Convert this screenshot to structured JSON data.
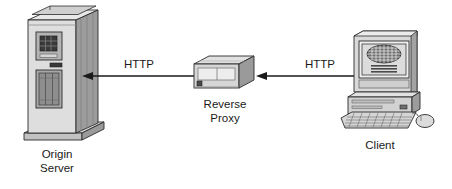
{
  "diagram": {
    "background_color": "#ffffff",
    "line_color": "#1a1a1a",
    "text_color": "#1a1a1a",
    "nodes": [
      {
        "id": "origin-server",
        "icon": "server-tower-icon",
        "label_line1": "Origin",
        "label_line2": "Server",
        "label_position": "below"
      },
      {
        "id": "reverse-proxy",
        "icon": "rack-appliance-icon",
        "label_line1": "Reverse",
        "label_line2": "Proxy",
        "label_position": "below"
      },
      {
        "id": "client",
        "icon": "desktop-computer-icon",
        "label_line1": "Client",
        "label_line2": "",
        "label_position": "below"
      }
    ],
    "connections": [
      {
        "id": "proxy-to-origin",
        "from": "reverse-proxy",
        "to": "origin-server",
        "label": "HTTP",
        "direction": "left",
        "arrowhead": "at-origin-server"
      },
      {
        "id": "client-to-proxy",
        "from": "client",
        "to": "reverse-proxy",
        "label": "HTTP",
        "direction": "left",
        "arrowhead": "at-reverse-proxy"
      }
    ],
    "palette": {
      "shade_light": "#e4e4e4",
      "shade_mid": "#c4c4c4",
      "shade_dark": "#9a9a9a",
      "shade_darker": "#6f6f6f",
      "outline": "#2b2b2b",
      "screen_fill": "#d8d8d8"
    }
  }
}
